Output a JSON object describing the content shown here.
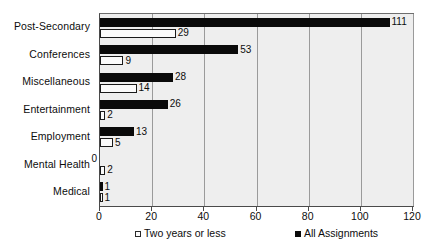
{
  "chart_data": {
    "type": "bar",
    "orientation": "horizontal",
    "title": "",
    "xlabel": "",
    "ylabel": "",
    "xlim": [
      0,
      120
    ],
    "xticks": [
      0,
      20,
      40,
      60,
      80,
      100,
      120
    ],
    "grid": true,
    "legend_position": "bottom",
    "categories": [
      "Post-Secondary",
      "Conferences",
      "Miscellaneous",
      "Entertainment",
      "Employment",
      "Mental Health",
      "Medical"
    ],
    "series": [
      {
        "name": "All Assignments",
        "color": "#0a0a0a",
        "values": [
          111,
          53,
          28,
          26,
          13,
          0,
          1
        ]
      },
      {
        "name": "Two years or less",
        "color": "#fbfbfb",
        "values": [
          29,
          9,
          14,
          2,
          5,
          2,
          1
        ]
      }
    ]
  },
  "legend": {
    "light_label": "Two years or less",
    "dark_label": "All Assignments"
  },
  "colors": {
    "plot_background": "#eeeeee",
    "gridline": "#9a9a9a",
    "axis": "#4a4a4a",
    "dark_series": "#0a0a0a",
    "light_series": "#fbfbfb",
    "text": "#0d0d0d"
  }
}
